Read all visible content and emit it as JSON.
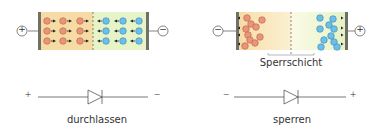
{
  "colors": {
    "p_region": "#f6dca4",
    "n_region": "#e6f4c8",
    "depletion_p": "#fbeccb",
    "depletion_n": "#f6f8de",
    "hole": "#e8957a",
    "electron": "#6cc0e8",
    "contact": "#6f7068",
    "line": "#555555"
  },
  "panels": [
    {
      "id": "forward",
      "left_terminal": "+",
      "right_terminal": "−",
      "caption": "durchlassen",
      "diode_left_sign": "+",
      "diode_right_sign": "−"
    },
    {
      "id": "reverse",
      "left_terminal": "−",
      "right_terminal": "+",
      "region_label": "Sperrschicht",
      "caption": "sperren",
      "diode_left_sign": "−",
      "diode_right_sign": "+"
    }
  ]
}
